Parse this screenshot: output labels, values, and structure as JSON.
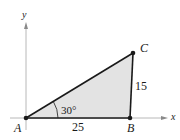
{
  "figure": {
    "axes": {
      "x_label": "x",
      "y_label": "y"
    },
    "points": {
      "A": {
        "label": "A"
      },
      "B": {
        "label": "B"
      },
      "C": {
        "label": "C"
      }
    },
    "measurements": {
      "side_AB": "25",
      "side_BC": "15",
      "angle_A": "30°"
    },
    "colors": {
      "fill": "#e3e3e3",
      "stroke": "#1a1a1a",
      "axis": "#b8b8b8"
    }
  }
}
